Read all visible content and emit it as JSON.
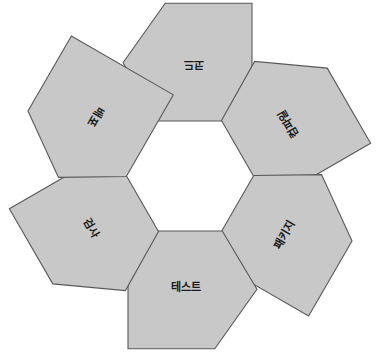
{
  "canvas": {
    "width": 379,
    "height": 353,
    "background": "#ffffff"
  },
  "diagram": {
    "type": "cycle",
    "title": "",
    "node_count": 6,
    "center_x": 190,
    "center_y": 176,
    "ring_radius": 112,
    "shape": "pentagon-arrow",
    "fill_color": "#c8c8c8",
    "stroke_color": "#595959",
    "text_color": "#1a1a1a",
    "nodes": [
      {
        "id": "node-code",
        "label": "코드",
        "angle": 0,
        "rotation": 180,
        "cx": 190,
        "cy": 64,
        "size": 62
      },
      {
        "id": "node-compile",
        "label": "컴파일",
        "angle": 60,
        "rotation": 240,
        "cx": 287,
        "cy": 120,
        "size": 62
      },
      {
        "id": "node-package",
        "label": "패키지",
        "angle": 120,
        "rotation": 300,
        "cx": 287,
        "cy": 232,
        "size": 62
      },
      {
        "id": "node-test",
        "label": "테스트",
        "angle": 180,
        "rotation": 0,
        "cx": 190,
        "cy": 288,
        "size": 62
      },
      {
        "id": "node-check",
        "label": "검사",
        "angle": 240,
        "rotation": 60,
        "cx": 93,
        "cy": 232,
        "size": 62
      },
      {
        "id": "node-deploy",
        "label": "배포",
        "angle": 300,
        "rotation": 120,
        "cx": 93,
        "cy": 120,
        "size": 62
      }
    ]
  }
}
